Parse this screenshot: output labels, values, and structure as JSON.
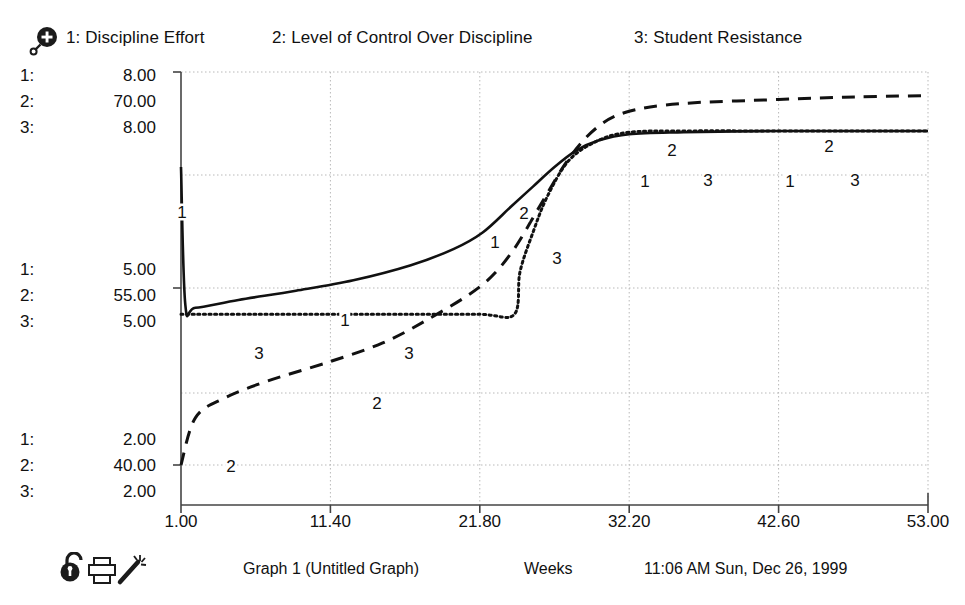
{
  "toolbar_top": {
    "zoom_icon": "magnifier-plus-icon"
  },
  "legend": {
    "items": [
      {
        "key": "1",
        "label": "1: Discipline Effort"
      },
      {
        "key": "2",
        "label": "2: Level of Control Over Discipline"
      },
      {
        "key": "3",
        "label": "3: Student Resistance"
      }
    ]
  },
  "y_scales": {
    "top": [
      {
        "idx": "1:",
        "value": "8.00"
      },
      {
        "idx": "2:",
        "value": "70.00"
      },
      {
        "idx": "3:",
        "value": "8.00"
      }
    ],
    "mid": [
      {
        "idx": "1:",
        "value": "5.00"
      },
      {
        "idx": "2:",
        "value": "55.00"
      },
      {
        "idx": "3:",
        "value": "5.00"
      }
    ],
    "bottom": [
      {
        "idx": "1:",
        "value": "2.00"
      },
      {
        "idx": "2:",
        "value": "40.00"
      },
      {
        "idx": "3:",
        "value": "2.00"
      }
    ]
  },
  "x_axis": {
    "label": "Weeks",
    "ticks": [
      "1.00",
      "11.40",
      "21.80",
      "32.20",
      "42.60",
      "53.00"
    ]
  },
  "status": {
    "graph_title": "Graph 1 (Untitled Graph)",
    "units": "Weeks",
    "timestamp": "11:06 AM Sun, Dec 26, 1999",
    "icons": [
      "unlock-padlock-icon",
      "printer-icon",
      "wand-icon"
    ]
  },
  "curve_markers": [
    {
      "series": "1",
      "x": 182,
      "y": 212
    },
    {
      "series": "1",
      "x": 345,
      "y": 320
    },
    {
      "series": "1",
      "x": 495,
      "y": 242
    },
    {
      "series": "1",
      "x": 645,
      "y": 181
    },
    {
      "series": "1",
      "x": 790,
      "y": 181
    },
    {
      "series": "2",
      "x": 231,
      "y": 466
    },
    {
      "series": "2",
      "x": 377,
      "y": 403
    },
    {
      "series": "2",
      "x": 524,
      "y": 213
    },
    {
      "series": "2",
      "x": 672,
      "y": 150
    },
    {
      "series": "2",
      "x": 829,
      "y": 146
    },
    {
      "series": "3",
      "x": 259,
      "y": 353
    },
    {
      "series": "3",
      "x": 409,
      "y": 353
    },
    {
      "series": "3",
      "x": 557,
      "y": 258
    },
    {
      "series": "3",
      "x": 708,
      "y": 180
    },
    {
      "series": "3",
      "x": 855,
      "y": 180
    }
  ],
  "chart_data": {
    "type": "line",
    "title": "Graph 1 (Untitled Graph)",
    "xlabel": "Weeks",
    "ylabel": "",
    "grid": true,
    "legend_position": "top",
    "xlim": [
      1.0,
      53.0
    ],
    "xticks": [
      1.0,
      11.4,
      21.8,
      32.2,
      42.6,
      53.0
    ],
    "y_axes": [
      {
        "series": "1",
        "name": "Discipline Effort",
        "range": [
          2.0,
          8.0
        ],
        "ticks": [
          2.0,
          5.0,
          8.0
        ],
        "style": "solid"
      },
      {
        "series": "2",
        "name": "Level of Control Over Discipline",
        "range": [
          40.0,
          70.0
        ],
        "ticks": [
          40.0,
          55.0,
          70.0
        ],
        "style": "dashed"
      },
      {
        "series": "3",
        "name": "Student Resistance",
        "range": [
          2.0,
          8.0
        ],
        "ticks": [
          2.0,
          5.0,
          8.0
        ],
        "style": "dotted"
      }
    ],
    "series": [
      {
        "name": "Discipline Effort",
        "key": "1",
        "style": "solid",
        "x": [
          1.0,
          1.3,
          2.0,
          5.0,
          9.0,
          13.0,
          17.0,
          20.0,
          22.0,
          24.0,
          25.5,
          27.0,
          28.5,
          30.0,
          32.2,
          36.0,
          42.6,
          48.0,
          53.0
        ],
        "y": [
          6.55,
          4.45,
          4.4,
          4.52,
          4.66,
          4.82,
          5.05,
          5.3,
          5.55,
          5.95,
          6.25,
          6.55,
          6.8,
          6.95,
          7.05,
          7.08,
          7.1,
          7.1,
          7.1
        ]
      },
      {
        "name": "Level of Control Over Discipline",
        "key": "2",
        "style": "dashed",
        "x": [
          1.0,
          2.0,
          4.0,
          7.0,
          11.4,
          15.0,
          18.0,
          21.8,
          24.0,
          26.0,
          28.0,
          30.0,
          32.2,
          36.0,
          42.6,
          48.0,
          53.0
        ],
        "y": [
          40.0,
          43.6,
          45.1,
          46.4,
          47.9,
          49.3,
          51.0,
          53.6,
          56.2,
          59.8,
          63.4,
          65.8,
          67.0,
          67.6,
          67.9,
          68.1,
          68.2
        ]
      },
      {
        "name": "Student Resistance",
        "key": "3",
        "style": "dotted",
        "x": [
          1.0,
          6.0,
          11.4,
          16.0,
          21.8,
          24.2,
          24.6,
          25.5,
          26.5,
          28.0,
          30.0,
          32.2,
          36.0,
          42.6,
          48.0,
          53.0
        ],
        "y": [
          4.3,
          4.3,
          4.3,
          4.3,
          4.3,
          4.3,
          4.95,
          5.55,
          6.1,
          6.65,
          6.95,
          7.08,
          7.1,
          7.1,
          7.1,
          7.1
        ]
      }
    ]
  },
  "colors": {
    "ink": "#111111",
    "grid": "#b9b9b9",
    "axis": "#444444",
    "background": "#ffffff"
  }
}
